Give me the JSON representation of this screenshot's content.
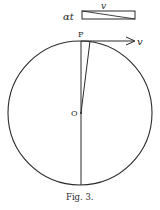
{
  "figure": {
    "caption": "Fig. 3.",
    "labels": {
      "top_box_side": "αt",
      "top_box_top": "v",
      "point_P": "P",
      "point_O": "O",
      "velocity": "v"
    },
    "circle": {
      "cx": 80,
      "cy": 113,
      "r": 72
    },
    "colors": {
      "ink": "#2a2a2a",
      "background": "#ffffff"
    }
  }
}
